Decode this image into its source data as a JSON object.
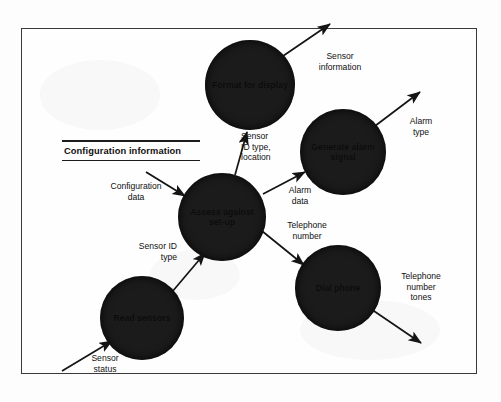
{
  "diagram": {
    "type": "data-flow-diagram",
    "data_store": {
      "name": "configuration-information-store",
      "label": "Configuration information"
    },
    "processes": [
      {
        "id": "format-for-display",
        "label": "Format\nfor\ndisplay",
        "cx": 250,
        "cy": 85,
        "r": 45
      },
      {
        "id": "generate-alarm-signal",
        "label": "Generate\nalarm\nsignal",
        "cx": 343,
        "cy": 152,
        "r": 43
      },
      {
        "id": "assess-against-set-up",
        "label": "Assess\nagainst\nset-up",
        "cx": 222,
        "cy": 217,
        "r": 44
      },
      {
        "id": "dial-phone",
        "label": "Dial\nphone",
        "cx": 338,
        "cy": 288,
        "r": 43
      },
      {
        "id": "read-sensors",
        "label": "Read\nsensors",
        "cx": 142,
        "cy": 318,
        "r": 42
      }
    ],
    "flows": [
      {
        "id": "sensor-information",
        "label": "Sensor\ninformation",
        "align": "center"
      },
      {
        "id": "alarm-type",
        "label": "Alarm\ntype",
        "align": "center"
      },
      {
        "id": "sensor-id-type-location",
        "label": "Sensor\nID type,\nlocation",
        "align": "left"
      },
      {
        "id": "configuration-data",
        "label": "Configuration\ndata",
        "align": "center"
      },
      {
        "id": "alarm-data",
        "label": "Alarm\ndata",
        "align": "center"
      },
      {
        "id": "telephone-number",
        "label": "Telephone\nnumber",
        "align": "center"
      },
      {
        "id": "telephone-number-tones",
        "label": "Telephone\nnumber\ntones",
        "align": "center"
      },
      {
        "id": "sensor-id-type",
        "label": "Sensor ID\ntype",
        "align": "right"
      },
      {
        "id": "sensor-status",
        "label": "Sensor\nstatus",
        "align": "center"
      }
    ],
    "colors": {
      "process_fill": "#1b1b1b",
      "line": "#1c1c1c",
      "frame": "#3a3a3a",
      "page": "#fefefe",
      "text": "#111111"
    }
  }
}
